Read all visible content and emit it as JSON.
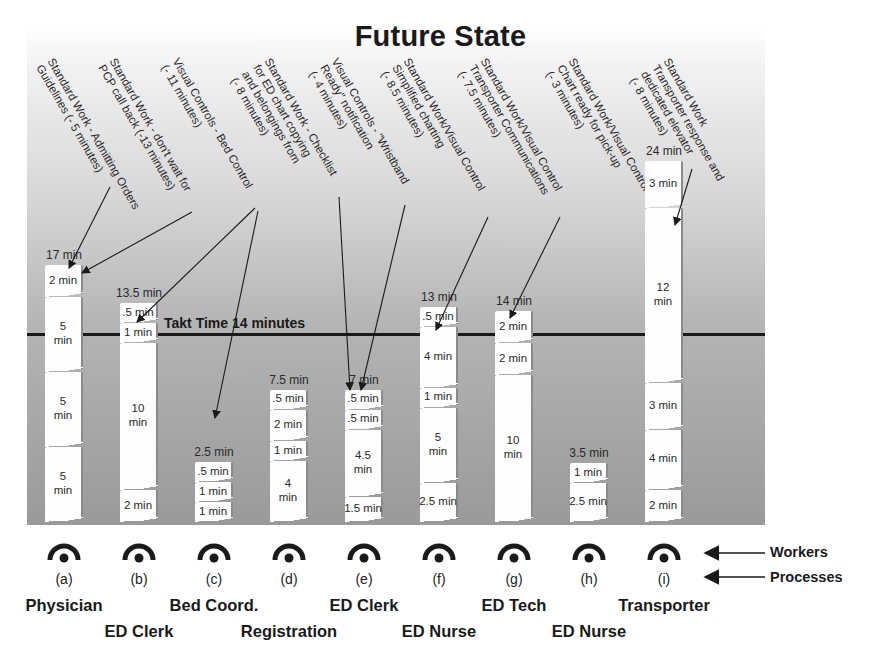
{
  "title": "Future State",
  "takt": {
    "label": "Takt Time 14 minutes",
    "minutes": 14
  },
  "legend": {
    "workers": "Workers",
    "processes": "Processes"
  },
  "annotations": [
    {
      "id": "a1",
      "text": "Standard Work - Admitting Orders\nGuidelines (- 5 minutes)",
      "target": "a"
    },
    {
      "id": "a2",
      "text": "Standard Work - don't wait for\nPCP call back (-13 minutes)",
      "target": "a"
    },
    {
      "id": "a3",
      "text": "Visual Controls - Bed Control\n(- 11 minutes)",
      "target": "b,c"
    },
    {
      "id": "a4",
      "text": "Standard Work - Checklist\nfor ED chart copying\nand belongings from\n(- 8 minutes)",
      "target": "e"
    },
    {
      "id": "a5",
      "text": "Visual Controls - \"Wristband\nReady\" notification\n(- 4 minutes)",
      "target": "e"
    },
    {
      "id": "a6",
      "text": "Standard Work/Visual Control\nSimplified charting\n(- 8.5 minutes)",
      "target": "f"
    },
    {
      "id": "a7",
      "text": "Standard Work/Visual Control\nTransporter Communications\n(- 7.5 minutes)",
      "target": "g"
    },
    {
      "id": "a8",
      "text": "Standard Work/Visual Control\nChart ready for pick-up\n(- 3 minutes)",
      "target": "i"
    },
    {
      "id": "a9",
      "text": "Standard Work\nTransporter response and\ndedicated elevator\n(- 8 minutes)",
      "target": "i"
    }
  ],
  "processes": [
    {
      "id": "a",
      "letter": "(a)",
      "role": "Physician",
      "total": "17 min",
      "segments": [
        "2 min",
        "5\nmin",
        "5\nmin",
        "5\nmin"
      ]
    },
    {
      "id": "b",
      "letter": "(b)",
      "role": "ED Clerk",
      "total": "13.5 min",
      "segments": [
        ".5 min",
        "1 min",
        "10\nmin",
        "2 min"
      ]
    },
    {
      "id": "c",
      "letter": "(c)",
      "role": "Bed Coord.",
      "total": "2.5 min",
      "segments": [
        ".5 min",
        "1 min",
        "1 min"
      ]
    },
    {
      "id": "d",
      "letter": "(d)",
      "role": "Registration",
      "total": "7.5 min",
      "segments": [
        ".5 min",
        "2 min",
        "1 min",
        "4\nmin"
      ]
    },
    {
      "id": "e",
      "letter": "(e)",
      "role": "ED Clerk",
      "total": "7 min",
      "segments": [
        ".5 min",
        ".5 min",
        "4.5\nmin",
        "1.5 min"
      ]
    },
    {
      "id": "f",
      "letter": "(f)",
      "role": "ED Nurse",
      "total": "13 min",
      "segments": [
        ".5 min",
        "4 min",
        "1 min",
        "5\nmin",
        "2.5 min"
      ]
    },
    {
      "id": "g",
      "letter": "(g)",
      "role": "ED Tech",
      "total": "14 min",
      "segments": [
        "2 min",
        "2 min",
        "10\nmin"
      ]
    },
    {
      "id": "h",
      "letter": "(h)",
      "role": "ED Nurse",
      "total": "3.5 min",
      "segments": [
        "1 min",
        "2.5 min"
      ]
    },
    {
      "id": "i",
      "letter": "(i)",
      "role": "Transporter",
      "total": "24 min",
      "segments": [
        "3 min",
        "12\nmin",
        "3 min",
        "4 min",
        "2 min"
      ]
    }
  ],
  "chart_data": {
    "type": "bar",
    "title": "Future State",
    "categories": [
      "(a) Physician",
      "(b) ED Clerk",
      "(c) Bed Coord.",
      "(d) Registration",
      "(e) ED Clerk",
      "(f) ED Nurse",
      "(g) ED Tech",
      "(h) ED Nurse",
      "(i) Transporter"
    ],
    "values": [
      17,
      13.5,
      2.5,
      7.5,
      7,
      13,
      14,
      3.5,
      24
    ],
    "stacked_segments": [
      [
        2,
        5,
        5,
        5
      ],
      [
        0.5,
        1,
        10,
        2
      ],
      [
        0.5,
        1,
        1
      ],
      [
        0.5,
        2,
        1,
        4
      ],
      [
        0.5,
        0.5,
        4.5,
        1.5
      ],
      [
        0.5,
        4,
        1,
        5,
        2.5
      ],
      [
        2,
        2,
        10
      ],
      [
        1,
        2.5
      ],
      [
        3,
        12,
        3,
        4,
        2
      ]
    ],
    "reference_line": {
      "label": "Takt Time 14 minutes",
      "value": 14
    },
    "xlabel": "Processes",
    "ylabel": "minutes"
  }
}
